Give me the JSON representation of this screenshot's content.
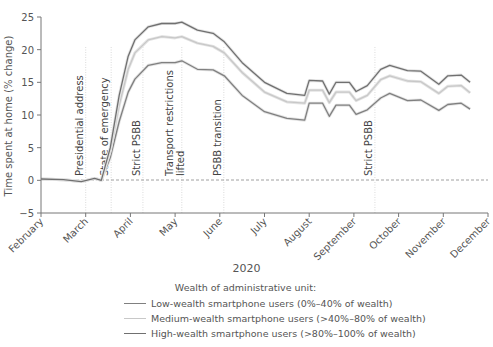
{
  "chart_data": {
    "type": "line",
    "title": "",
    "xlabel": "2020",
    "ylabel": "Time spent at home (% change)",
    "ylim": [
      -5,
      25
    ],
    "yticks": [
      -5,
      0,
      5,
      10,
      15,
      20,
      25
    ],
    "x_unit": "months since February 1, 2020 (0 = Feb, 10 = Dec)",
    "xlim": [
      0,
      10
    ],
    "x_tick_labels": [
      "February",
      "March",
      "April",
      "May",
      "June",
      "July",
      "August",
      "September",
      "October",
      "November",
      "December"
    ],
    "grid": false,
    "zero_reference_line": "dashed",
    "events": [
      {
        "x": 1.0,
        "label": "Presidential address"
      },
      {
        "x": 1.57,
        "label": "State of emergency"
      },
      {
        "x": 2.28,
        "label": "Strict PSBB"
      },
      {
        "x": 3.15,
        "label": "Transport restrictions lifted"
      },
      {
        "x": 4.09,
        "label": "PSBB transition"
      },
      {
        "x": 7.47,
        "label": "Strict PSBB"
      }
    ],
    "legend_title": "Wealth of administrative unit:",
    "legend_position": "bottom",
    "series": [
      {
        "name": "Low-wealth smartphone users (0%–40% of wealth)",
        "color": "#808080",
        "x": [
          0,
          0.5,
          0.9,
          1.2,
          1.35,
          1.55,
          1.75,
          1.95,
          2.1,
          2.4,
          2.7,
          3.0,
          3.15,
          3.5,
          3.85,
          4.1,
          4.5,
          5.0,
          5.5,
          5.9,
          6.0,
          6.3,
          6.45,
          6.6,
          6.9,
          7.05,
          7.3,
          7.6,
          7.8,
          8.2,
          8.5,
          8.9,
          9.1,
          9.4,
          9.6
        ],
        "values": [
          0.2,
          0.1,
          -0.2,
          0.3,
          0.0,
          3.5,
          9.0,
          13.5,
          15.5,
          17.6,
          18.0,
          18.0,
          18.3,
          17.0,
          16.9,
          16.0,
          13.0,
          10.5,
          9.5,
          9.2,
          11.8,
          11.8,
          9.8,
          11.5,
          11.5,
          10.1,
          10.8,
          12.6,
          13.3,
          12.2,
          12.3,
          10.7,
          11.6,
          11.8,
          10.9
        ]
      },
      {
        "name": "Medium-wealth smartphone users (>40%–80% of wealth)",
        "color": "#c8c8c8",
        "x": [
          0,
          0.5,
          0.9,
          1.2,
          1.35,
          1.55,
          1.75,
          1.95,
          2.1,
          2.4,
          2.7,
          3.0,
          3.15,
          3.5,
          3.85,
          4.1,
          4.5,
          5.0,
          5.5,
          5.9,
          6.0,
          6.3,
          6.45,
          6.6,
          6.9,
          7.05,
          7.3,
          7.6,
          7.8,
          8.2,
          8.5,
          8.9,
          9.1,
          9.4,
          9.6
        ],
        "values": [
          0.2,
          0.1,
          -0.2,
          0.3,
          0.0,
          4.5,
          11.5,
          17.0,
          19.5,
          21.5,
          22.0,
          21.8,
          22.0,
          21.0,
          20.5,
          19.5,
          16.5,
          13.5,
          12.0,
          11.8,
          13.8,
          13.8,
          11.9,
          13.5,
          13.5,
          12.2,
          13.0,
          15.4,
          16.0,
          15.2,
          15.1,
          13.3,
          14.4,
          14.5,
          13.4
        ]
      },
      {
        "name": "High-wealth smartphone users (>80%–100% of wealth)",
        "color": "#707070",
        "x": [
          0,
          0.5,
          0.9,
          1.2,
          1.35,
          1.55,
          1.75,
          1.95,
          2.1,
          2.4,
          2.7,
          3.0,
          3.15,
          3.5,
          3.85,
          4.1,
          4.5,
          5.0,
          5.5,
          5.9,
          6.0,
          6.3,
          6.45,
          6.6,
          6.9,
          7.05,
          7.3,
          7.6,
          7.8,
          8.2,
          8.5,
          8.9,
          9.1,
          9.4,
          9.6
        ],
        "values": [
          0.2,
          0.1,
          -0.2,
          0.3,
          0.0,
          5.0,
          13.0,
          19.0,
          21.5,
          23.5,
          24.0,
          24.0,
          24.2,
          23.0,
          22.5,
          21.2,
          18.0,
          15.0,
          13.3,
          13.0,
          15.3,
          15.2,
          13.2,
          15.0,
          15.0,
          13.6,
          14.5,
          17.0,
          17.6,
          16.8,
          16.7,
          14.7,
          16.0,
          16.1,
          15.0
        ]
      }
    ]
  }
}
